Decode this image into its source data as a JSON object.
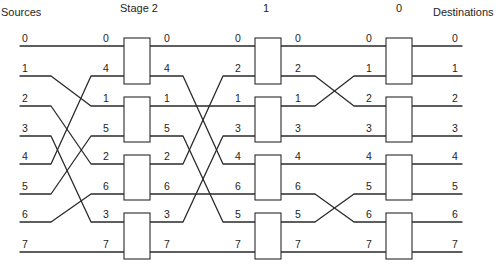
{
  "diagram": {
    "type": "omega-network",
    "headers": {
      "sources": "Sources",
      "destinations": "Destinations",
      "stages": [
        "Stage 2",
        "1",
        "0"
      ]
    },
    "sources": [
      "0",
      "1",
      "2",
      "3",
      "4",
      "5",
      "6",
      "7"
    ],
    "destinations": [
      "0",
      "1",
      "2",
      "3",
      "4",
      "5",
      "6",
      "7"
    ],
    "stage2": {
      "inputs": [
        "0",
        "4",
        "1",
        "5",
        "2",
        "6",
        "3",
        "7"
      ],
      "outputs": [
        "0",
        "4",
        "1",
        "5",
        "2",
        "6",
        "3",
        "7"
      ]
    },
    "stage1": {
      "inputs": [
        "0",
        "2",
        "1",
        "3",
        "4",
        "6",
        "5",
        "7"
      ],
      "outputs": [
        "0",
        "2",
        "1",
        "3",
        "4",
        "6",
        "5",
        "7"
      ]
    },
    "stage0": {
      "inputs": [
        "0",
        "1",
        "2",
        "3",
        "4",
        "5",
        "6",
        "7"
      ]
    },
    "switch_boxes_per_stage": 4
  }
}
